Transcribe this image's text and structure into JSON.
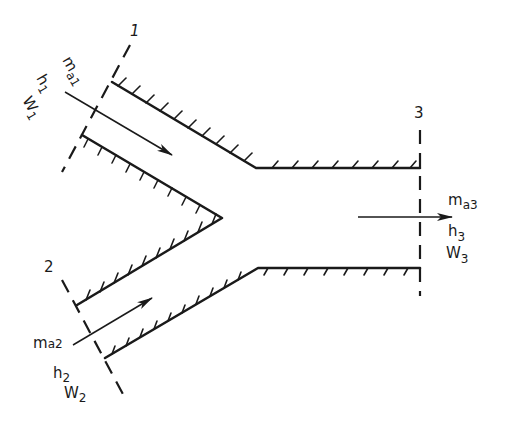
{
  "diagram": {
    "colors": {
      "ink": "#1a1a1a",
      "background": "#ffffff"
    },
    "sections": [
      {
        "id": "1",
        "label": "1"
      },
      {
        "id": "2",
        "label": "2"
      },
      {
        "id": "3",
        "label": "3"
      }
    ],
    "streams": {
      "inlet1": {
        "mass_flow": "m",
        "mass_sub": "a1",
        "enthalpy": "h",
        "enthalpy_sub": "1",
        "humidity": "W",
        "humidity_sub": "1"
      },
      "inlet2": {
        "mass_flow": "m",
        "mass_sub": "a2",
        "enthalpy": "h",
        "enthalpy_sub": "2",
        "humidity": "W",
        "humidity_sub": "2"
      },
      "outlet3": {
        "mass_flow": "m",
        "mass_sub": "a3",
        "enthalpy": "h",
        "enthalpy_sub": "3",
        "humidity": "W",
        "humidity_sub": "3"
      }
    }
  }
}
